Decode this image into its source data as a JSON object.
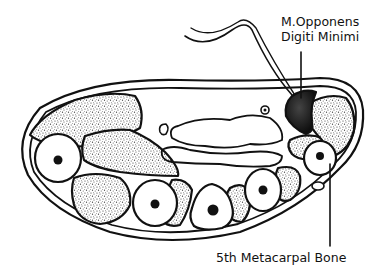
{
  "diagram": {
    "type": "anatomical cross-section",
    "labels": {
      "muscle_line1": "M.Opponens",
      "muscle_line2": "Digiti Minimi",
      "bone": "5th  Metacarpal Bone"
    },
    "colors": {
      "stroke": "#111111",
      "background": "#ffffff",
      "stipple": "#3a3a3a",
      "dark_muscle": "#1a1a1a"
    }
  }
}
